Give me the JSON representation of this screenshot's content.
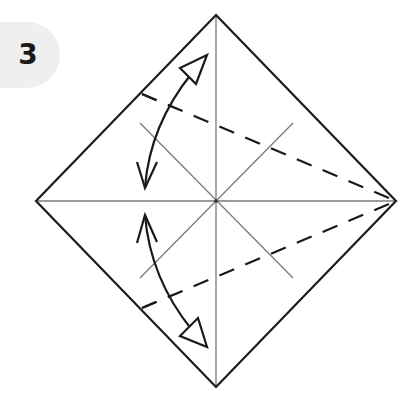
{
  "step": {
    "number": "3"
  },
  "diagram": {
    "elements": [
      "diamond-outline",
      "vertical-crease",
      "horizontal-crease",
      "diagonal-creases",
      "upper-valley-fold-dashed",
      "lower-valley-fold-dashed",
      "upper-fold-unfold-arrow",
      "lower-fold-unfold-arrow"
    ],
    "colors": {
      "outline": "#1a1a1a",
      "crease": "#777777",
      "badge": "#efefef"
    }
  }
}
